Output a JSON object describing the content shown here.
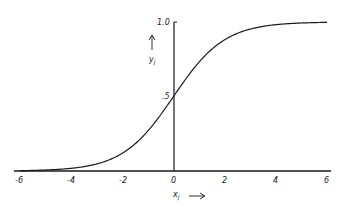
{
  "chart_data": {
    "type": "line",
    "title": "",
    "xlabel": "x_j",
    "ylabel": "y_j",
    "xlim": [
      -6,
      6
    ],
    "ylim": [
      0,
      1.0
    ],
    "x_ticks": [
      "-6",
      "-4",
      "-2",
      "0",
      "2",
      "4",
      "6"
    ],
    "y_ticks": [
      ".5",
      "1.0"
    ],
    "grid": false,
    "legend": null,
    "series": [
      {
        "name": "logistic sigmoid y_j = 1/(1+e^(-x_j))",
        "x": [
          -6,
          -5,
          -4,
          -3,
          -2,
          -1,
          0,
          1,
          2,
          3,
          4,
          5,
          6
        ],
        "values": [
          0.002,
          0.007,
          0.018,
          0.047,
          0.119,
          0.269,
          0.5,
          0.731,
          0.881,
          0.953,
          0.982,
          0.993,
          0.998
        ]
      }
    ]
  },
  "labels": {
    "x_axis": "x",
    "x_sub": "j",
    "y_axis": "y",
    "y_sub": "j",
    "y_top": "1.0",
    "y_mid": ".5",
    "x_ticks": [
      "-6",
      "-4",
      "-2",
      "0",
      "2",
      "4",
      "6"
    ]
  }
}
